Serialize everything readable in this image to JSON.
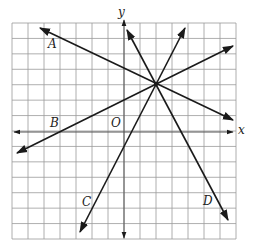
{
  "diagram": {
    "type": "coordinate-plane",
    "grid": {
      "columns": 14,
      "rows": 14,
      "x_range": [
        -7,
        7
      ],
      "y_range": [
        -7,
        7
      ]
    },
    "axes": {
      "x_label": "x",
      "y_label": "y",
      "origin_label": "O"
    },
    "intersection_point": [
      2,
      3
    ],
    "lines": [
      {
        "id": "A",
        "label": "A",
        "description": "negative slope, shallow"
      },
      {
        "id": "B",
        "label": "B",
        "description": "positive slope, shallow"
      },
      {
        "id": "C",
        "label": "C",
        "description": "positive slope, steep"
      },
      {
        "id": "D",
        "label": "D",
        "description": "negative slope, steep"
      }
    ],
    "colors": {
      "grid": "#9a9a9a",
      "lines": "#1a1a1a",
      "background": "#ffffff"
    }
  }
}
